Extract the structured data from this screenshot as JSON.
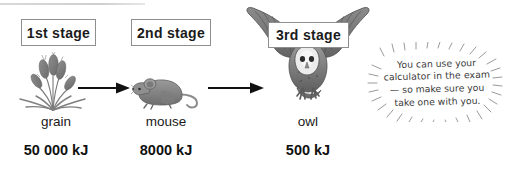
{
  "diagram": {
    "type": "food-chain",
    "stages": [
      {
        "stage_label": "1st stage",
        "organism": "grain",
        "energy": "50 000 kJ",
        "energy_value": 50000,
        "energy_unit": "kJ",
        "icon": "grain-stalks-icon"
      },
      {
        "stage_label": "2nd stage",
        "organism": "mouse",
        "energy": "8000 kJ",
        "energy_value": 8000,
        "energy_unit": "kJ",
        "icon": "mouse-icon"
      },
      {
        "stage_label": "3rd stage",
        "organism": "owl",
        "energy": "500 kJ",
        "energy_value": 500,
        "energy_unit": "kJ",
        "icon": "barn-owl-icon"
      }
    ],
    "arrows": [
      {
        "name": "arrow-grain-to-mouse",
        "direction": "right"
      },
      {
        "name": "arrow-mouse-to-owl",
        "direction": "right"
      }
    ]
  },
  "exam_tip": {
    "line1": "You can use your",
    "line2": "calculator in the exam",
    "line3": "— so make sure you",
    "line4": "take one with you."
  },
  "colors": {
    "page_background": "#ffffff",
    "box_border": "#8e8e8e",
    "text": "#1a1a1a",
    "arrow": "#111111",
    "illustration_gray": "#7d7d7d",
    "tip_text": "#3a3a3a",
    "rule": "#d8d8d8"
  }
}
